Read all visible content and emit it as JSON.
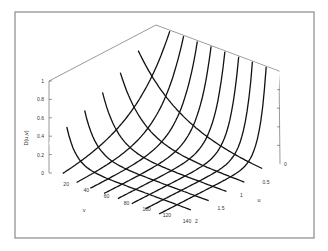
{
  "chart_data": {
    "type": "surface3d",
    "title": "",
    "xlabel": "v",
    "ylabel": "u",
    "zlabel": "D(u,v)",
    "x_axis": {
      "name": "v",
      "range": [
        0,
        140
      ],
      "ticks": [
        0,
        20,
        40,
        60,
        80,
        100,
        120,
        140
      ],
      "tick_labels": [
        "0",
        "20",
        "40",
        "60",
        "80",
        "100",
        "120",
        "140"
      ]
    },
    "y_axis": {
      "name": "u",
      "range": [
        0,
        2
      ],
      "ticks": [
        0,
        0.5,
        1,
        1.5,
        2
      ],
      "tick_labels": [
        "0",
        "0.5",
        "1",
        "1.5",
        "2"
      ]
    },
    "z_axis": {
      "name": "D(u,v)",
      "range": [
        0,
        1
      ],
      "ticks": [
        0,
        0.2,
        0.4,
        0.6,
        0.8,
        1
      ],
      "tick_labels": [
        "0",
        "0.2",
        "0.4",
        "0.6",
        "0.8",
        "1"
      ]
    },
    "sample_points": [
      {
        "v": 0,
        "u": 0,
        "z": 1.0
      },
      {
        "v": 0,
        "u": 2,
        "z": 0.33
      },
      {
        "v": 20,
        "u": 2,
        "z": 0.15
      },
      {
        "v": 140,
        "u": 0,
        "z": 1.0
      },
      {
        "v": 140,
        "u": 0.5,
        "z": 0.02
      },
      {
        "v": 140,
        "u": 2,
        "z": 0.0
      }
    ],
    "grid": {
      "v_lines": 29,
      "u_lines": 29
    },
    "legend": null
  },
  "figure": {
    "frame_color": "#8a8a8a",
    "mesh_color": "#555555",
    "highlight_color": "#111111",
    "background": "#ffffff"
  }
}
